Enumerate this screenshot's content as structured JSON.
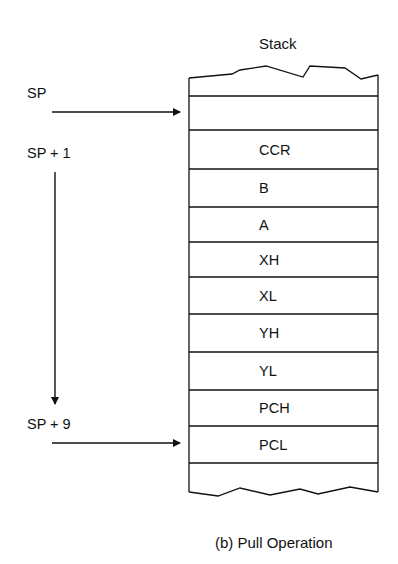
{
  "diagram": {
    "title": "Stack",
    "caption": "(b) Pull Operation",
    "pointers": {
      "sp": "SP",
      "sp_plus_1": "SP + 1",
      "sp_plus_9": "SP + 9"
    },
    "stack_cells": [
      "",
      "CCR",
      "B",
      "A",
      "XH",
      "XL",
      "YH",
      "YL",
      "PCH",
      "PCL",
      ""
    ],
    "colors": {
      "line": "#111111",
      "background": "#ffffff"
    }
  }
}
